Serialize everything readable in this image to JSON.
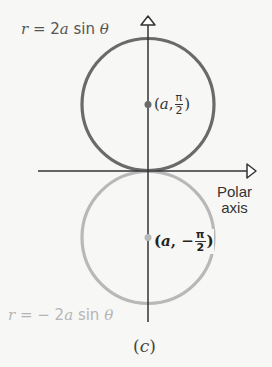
{
  "figure": {
    "caption": "(c)",
    "caption_letter": "c",
    "colors": {
      "upper_circle": "#6a6a6a",
      "lower_circle": "#b8b8b8",
      "axes": "#333333",
      "background": "#f7f7f5"
    },
    "upper_curve": {
      "equation_lhs": "r",
      "equation_eq": " = 2",
      "equation_a": "a",
      "equation_rest": " sin ",
      "equation_theta": "θ",
      "full": "r = 2a sin θ",
      "point": {
        "open": "(",
        "a": "a",
        "sep": ", ",
        "numerator": "π",
        "denominator": "2",
        "close": ")",
        "full": "(a, π/2)"
      }
    },
    "lower_curve": {
      "equation_lhs": "r",
      "equation_eq": " = − 2",
      "equation_a": "a",
      "equation_rest": " sin ",
      "equation_theta": "θ",
      "full": "r = − 2a sin θ",
      "point": {
        "open": "(",
        "a": "a",
        "sep": ", − ",
        "numerator": "π",
        "denominator": "2",
        "close": ")",
        "full": "(a, −π/2)"
      }
    },
    "axis_label_line1": "Polar",
    "axis_label_line2": "axis"
  }
}
